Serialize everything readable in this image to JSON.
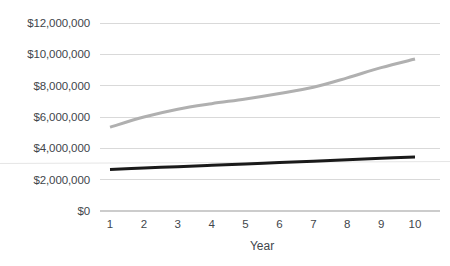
{
  "chart_data": {
    "type": "line",
    "title": "",
    "subtitle": "",
    "xlabel": "Year",
    "ylabel": "",
    "x": [
      1,
      2,
      3,
      4,
      5,
      6,
      7,
      8,
      9,
      10
    ],
    "xtick_labels": [
      "1",
      "2",
      "3",
      "4",
      "5",
      "6",
      "7",
      "8",
      "9",
      "10"
    ],
    "ytick_labels": [
      "$12,000,000",
      "$10,000,000",
      "$8,000,000",
      "$6,000,000",
      "$4,000,000",
      "$2,000,000",
      "$0"
    ],
    "ytick_values": [
      12000000,
      10000000,
      8000000,
      6000000,
      4000000,
      2000000,
      0
    ],
    "xlim": [
      1,
      10
    ],
    "ylim": [
      0,
      12000000
    ],
    "grid": "horizontal",
    "legend": "none",
    "series": [
      {
        "name": "gray-series",
        "color": "#b0b0b0",
        "values": [
          5350000,
          6000000,
          6500000,
          6850000,
          7150000,
          7500000,
          7900000,
          8500000,
          9150000,
          9700000
        ]
      },
      {
        "name": "black-series",
        "color": "#1a1a1a",
        "values": [
          2650000,
          2740000,
          2830000,
          2920000,
          3000000,
          3090000,
          3180000,
          3270000,
          3360000,
          3450000
        ]
      }
    ]
  },
  "axis": {
    "x_title": "Year"
  }
}
